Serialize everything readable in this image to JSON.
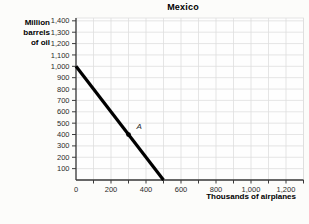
{
  "chart_data": {
    "type": "line",
    "title": "Mexico",
    "xlabel": "Thousands of airplanes",
    "ylabel": "Million barrels of oil",
    "ylabel_lines": [
      "Million",
      "barrels",
      "of oil"
    ],
    "xlim": [
      0,
      1300
    ],
    "ylim": [
      0,
      1425
    ],
    "grid": true,
    "grid_step": 100,
    "x_minor_tick_step": 100,
    "x_ticks": [
      {
        "v": 0,
        "label": "0"
      },
      {
        "v": 200,
        "label": "200"
      },
      {
        "v": 400,
        "label": "400"
      },
      {
        "v": 600,
        "label": "600"
      },
      {
        "v": 800,
        "label": "800"
      },
      {
        "v": 1000,
        "label": "1,000"
      },
      {
        "v": 1200,
        "label": "1,200"
      }
    ],
    "y_ticks": [
      {
        "v": 100,
        "label": "100"
      },
      {
        "v": 200,
        "label": "200"
      },
      {
        "v": 300,
        "label": "300"
      },
      {
        "v": 400,
        "label": "400"
      },
      {
        "v": 500,
        "label": "500"
      },
      {
        "v": 600,
        "label": "600"
      },
      {
        "v": 700,
        "label": "700"
      },
      {
        "v": 800,
        "label": "800"
      },
      {
        "v": 900,
        "label": "900"
      },
      {
        "v": 1000,
        "label": "1,000"
      },
      {
        "v": 1100,
        "label": "1,100"
      },
      {
        "v": 1200,
        "label": "1,200"
      },
      {
        "v": 1300,
        "label": "1,300"
      },
      {
        "v": 1400,
        "label": "1,400"
      }
    ],
    "series": [
      {
        "name": "production-possibility-frontier",
        "color": "#000000",
        "stroke_width": 3.2,
        "points": [
          [
            0,
            1000
          ],
          [
            500,
            0
          ]
        ]
      }
    ],
    "point_labels": [
      {
        "label": "A",
        "x": 300,
        "y": 400
      }
    ],
    "legend": "none"
  },
  "colors": {
    "background": "#fcfcfa",
    "plot_background": "#fefefe",
    "grid": "#dedede",
    "axis": "#3a3a3a",
    "text": "#2b2b2b",
    "marker": "#000000"
  }
}
